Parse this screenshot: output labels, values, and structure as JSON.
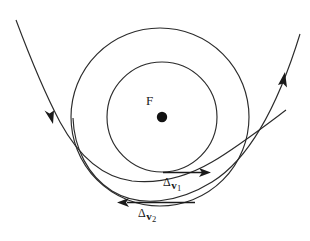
{
  "figure": {
    "kind": "orbital-transfer-diagram",
    "background_color": "#ffffff",
    "stroke_color": "#2b2b2b",
    "width": 310,
    "height": 241
  },
  "focus": {
    "label": "F",
    "dot_color": "#121212",
    "center_x": 162,
    "center_y": 117,
    "dot_radius": 5
  },
  "orbits": [
    {
      "name": "outer-circular-orbit",
      "center_x": 160,
      "center_y": 117,
      "radius": 89
    },
    {
      "name": "inner-circular-orbit",
      "center_x": 162,
      "center_y": 117,
      "radius": 55
    }
  ],
  "trajectories": [
    {
      "name": "incoming-hyperbolic-trajectory",
      "arrow_direction": "down",
      "arrow_x": 52,
      "arrow_y": 118
    },
    {
      "name": "outgoing-hyperbolic-trajectory",
      "arrow_direction": "up-right",
      "arrow_x": 283,
      "arrow_y": 80
    }
  ],
  "vectors": [
    {
      "name": "delta-v1",
      "delta": "Δ",
      "symbol": "v",
      "index": "1",
      "direction": "right",
      "x_start": 163,
      "x_end": 210,
      "y": 172
    },
    {
      "name": "delta-v2",
      "delta": "Δ",
      "symbol": "v",
      "index": "2",
      "direction": "left",
      "x_start": 195,
      "x_end": 118,
      "y": 203
    }
  ]
}
